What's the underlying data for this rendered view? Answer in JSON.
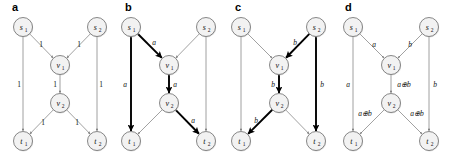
{
  "figure": {
    "width": 449,
    "height": 163,
    "background": "#ffffff",
    "stroke_thin": "#6e6e6e",
    "stroke_bold": "#000000",
    "node_fill": "#f2f2f2",
    "node_stroke": "#555555"
  },
  "node_names": {
    "s1": "s",
    "s1_sub": "1",
    "s2": "s",
    "s2_sub": "2",
    "v1": "v",
    "v1_sub": "1",
    "v2": "v",
    "v2_sub": "2",
    "t1": "t",
    "t1_sub": "1",
    "t2": "t",
    "t2_sub": "2"
  },
  "panels": [
    {
      "id": "a",
      "label": "a",
      "x": 0,
      "width": 113,
      "nodes": [
        {
          "id": "s1",
          "cx": 23,
          "cy": 27,
          "name": "s",
          "sub": "1"
        },
        {
          "id": "s2",
          "cx": 97,
          "cy": 27,
          "name": "s",
          "sub": "2"
        },
        {
          "id": "v1",
          "cx": 60,
          "cy": 65,
          "name": "v",
          "sub": "1"
        },
        {
          "id": "v2",
          "cx": 60,
          "cy": 103,
          "name": "v",
          "sub": "2"
        },
        {
          "id": "t1",
          "cx": 23,
          "cy": 141,
          "name": "t",
          "sub": "1"
        },
        {
          "id": "t2",
          "cx": 97,
          "cy": 141,
          "name": "t",
          "sub": "2"
        }
      ],
      "edges": [
        {
          "from": "s1",
          "to": "v1",
          "label": "1",
          "bold": false,
          "lx": 41,
          "ly": 44
        },
        {
          "from": "s2",
          "to": "v1",
          "label": "1",
          "bold": false,
          "lx": 79,
          "ly": 44
        },
        {
          "from": "v1",
          "to": "v2",
          "label": "1",
          "bold": false,
          "lx": 55,
          "ly": 84
        },
        {
          "from": "v2",
          "to": "t1",
          "label": "1",
          "bold": false,
          "lx": 43,
          "ly": 122
        },
        {
          "from": "v2",
          "to": "t2",
          "label": "1",
          "bold": false,
          "lx": 77,
          "ly": 122
        },
        {
          "from": "s1",
          "to": "t1",
          "label": "1",
          "bold": false,
          "lx": 19,
          "ly": 84
        },
        {
          "from": "s2",
          "to": "t2",
          "label": "1",
          "bold": false,
          "lx": 101,
          "ly": 84
        }
      ]
    },
    {
      "id": "b",
      "label": "b",
      "x": 113,
      "width": 110,
      "nodes": [
        {
          "id": "s1",
          "cx": 18,
          "cy": 27,
          "name": "s",
          "sub": "1"
        },
        {
          "id": "s2",
          "cx": 93,
          "cy": 27,
          "name": "s",
          "sub": "2"
        },
        {
          "id": "v1",
          "cx": 56,
          "cy": 65,
          "name": "v",
          "sub": "1"
        },
        {
          "id": "v2",
          "cx": 56,
          "cy": 103,
          "name": "v",
          "sub": "2"
        },
        {
          "id": "t1",
          "cx": 18,
          "cy": 141,
          "name": "t",
          "sub": "1"
        },
        {
          "id": "t2",
          "cx": 93,
          "cy": 141,
          "name": "t",
          "sub": "2"
        }
      ],
      "edges": [
        {
          "from": "s1",
          "to": "v1",
          "label": "a",
          "bold": true,
          "lx": 41,
          "ly": 42
        },
        {
          "from": "s2",
          "to": "v1",
          "label": "",
          "bold": false,
          "lx": 0,
          "ly": 0
        },
        {
          "from": "v1",
          "to": "v2",
          "label": "a",
          "bold": true,
          "lx": 62,
          "ly": 84
        },
        {
          "from": "v2",
          "to": "t1",
          "label": "",
          "bold": false,
          "lx": 0,
          "ly": 0
        },
        {
          "from": "v2",
          "to": "t2",
          "label": "a",
          "bold": true,
          "lx": 80,
          "ly": 120
        },
        {
          "from": "s1",
          "to": "t1",
          "label": "a",
          "bold": true,
          "lx": 12,
          "ly": 84
        },
        {
          "from": "s2",
          "to": "t2",
          "label": "",
          "bold": false,
          "lx": 0,
          "ly": 0
        }
      ]
    },
    {
      "id": "c",
      "label": "c",
      "x": 223,
      "width": 110,
      "nodes": [
        {
          "id": "s1",
          "cx": 18,
          "cy": 27,
          "name": "s",
          "sub": "1"
        },
        {
          "id": "s2",
          "cx": 93,
          "cy": 27,
          "name": "s",
          "sub": "2"
        },
        {
          "id": "v1",
          "cx": 56,
          "cy": 65,
          "name": "v",
          "sub": "1"
        },
        {
          "id": "v2",
          "cx": 56,
          "cy": 103,
          "name": "v",
          "sub": "2"
        },
        {
          "id": "t1",
          "cx": 18,
          "cy": 141,
          "name": "t",
          "sub": "1"
        },
        {
          "id": "t2",
          "cx": 93,
          "cy": 141,
          "name": "t",
          "sub": "2"
        }
      ],
      "edges": [
        {
          "from": "s1",
          "to": "v1",
          "label": "",
          "bold": false,
          "lx": 0,
          "ly": 0
        },
        {
          "from": "s2",
          "to": "v1",
          "label": "b",
          "bold": true,
          "lx": 72,
          "ly": 42
        },
        {
          "from": "v1",
          "to": "v2",
          "label": "b",
          "bold": true,
          "lx": 50,
          "ly": 84
        },
        {
          "from": "v2",
          "to": "t1",
          "label": "b",
          "bold": true,
          "lx": 33,
          "ly": 120
        },
        {
          "from": "v2",
          "to": "t2",
          "label": "",
          "bold": false,
          "lx": 0,
          "ly": 0
        },
        {
          "from": "s1",
          "to": "t1",
          "label": "",
          "bold": false,
          "lx": 0,
          "ly": 0
        },
        {
          "from": "s2",
          "to": "t2",
          "label": "b",
          "bold": true,
          "lx": 99,
          "ly": 84
        }
      ]
    },
    {
      "id": "d",
      "label": "d",
      "x": 333,
      "width": 116,
      "nodes": [
        {
          "id": "s1",
          "cx": 20,
          "cy": 27,
          "name": "s",
          "sub": "1"
        },
        {
          "id": "s2",
          "cx": 96,
          "cy": 27,
          "name": "s",
          "sub": "2"
        },
        {
          "id": "v1",
          "cx": 58,
          "cy": 65,
          "name": "v",
          "sub": "1"
        },
        {
          "id": "v2",
          "cx": 58,
          "cy": 103,
          "name": "v",
          "sub": "2"
        },
        {
          "id": "t1",
          "cx": 20,
          "cy": 141,
          "name": "t",
          "sub": "1"
        },
        {
          "id": "t2",
          "cx": 96,
          "cy": 141,
          "name": "t",
          "sub": "2"
        }
      ],
      "edges": [
        {
          "from": "s1",
          "to": "v1",
          "label": "a",
          "bold": false,
          "lx": 41,
          "ly": 44
        },
        {
          "from": "s2",
          "to": "v1",
          "label": "b",
          "bold": false,
          "lx": 77,
          "ly": 44
        },
        {
          "from": "v1",
          "to": "v2",
          "label": "a⊕b",
          "bold": false,
          "lx": 71,
          "ly": 84
        },
        {
          "from": "v2",
          "to": "t1",
          "label": "a⊕b",
          "bold": false,
          "lx": 32,
          "ly": 113
        },
        {
          "from": "v2",
          "to": "t2",
          "label": "a⊕b",
          "bold": false,
          "lx": 84,
          "ly": 113
        },
        {
          "from": "s1",
          "to": "t1",
          "label": "a",
          "bold": false,
          "lx": 15,
          "ly": 84
        },
        {
          "from": "s2",
          "to": "t2",
          "label": "b",
          "bold": false,
          "lx": 102,
          "ly": 84
        }
      ]
    }
  ]
}
